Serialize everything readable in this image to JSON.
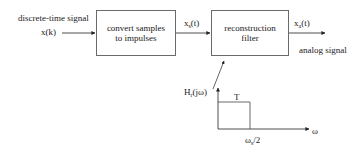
{
  "diagram": {
    "input": {
      "caption": "discrete-time signal",
      "signal_base": "x",
      "signal_arg": "(k)"
    },
    "block1": {
      "line1": "convert samples",
      "line2": "to impulses"
    },
    "intermediate_signal": {
      "base": "x",
      "subscript": "s",
      "arg": "(t)"
    },
    "block2": {
      "line1": "reconstruction",
      "line2": "filter"
    },
    "output": {
      "base": "x",
      "subscript": "a",
      "arg": "(t)",
      "caption": "analog signal"
    },
    "filter_response": {
      "y_label_base": "H",
      "y_label_subscript": "r",
      "y_label_arg": "(jω)",
      "amplitude_label": "T",
      "cutoff_base": "ω",
      "cutoff_subscript": "s",
      "cutoff_suffix": "/2",
      "x_axis_label": "ω"
    },
    "colors": {
      "line": "#222222",
      "box_border": "#6a6a6a",
      "text": "#1a1a1a"
    }
  }
}
